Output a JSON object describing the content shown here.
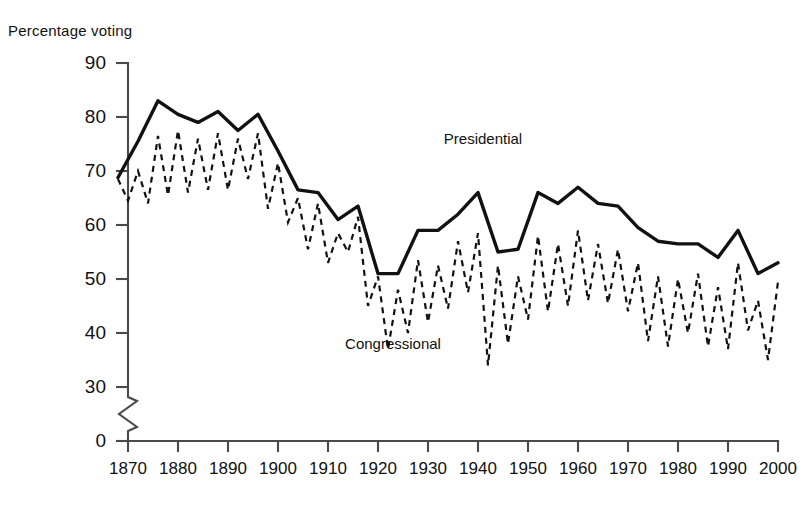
{
  "chart_data": {
    "type": "line",
    "title": "Percentage voting",
    "xlabel": "",
    "ylabel": "Percentage voting",
    "ylim": [
      0,
      90
    ],
    "xlim": [
      1868,
      2000
    ],
    "yticks": [
      0,
      30,
      40,
      50,
      60,
      70,
      80,
      90
    ],
    "xticks": [
      1870,
      1880,
      1890,
      1900,
      1910,
      1920,
      1930,
      1940,
      1950,
      1960,
      1970,
      1980,
      1990,
      2000
    ],
    "y_axis_break": true,
    "y_axis_break_between": [
      0,
      30
    ],
    "grid": false,
    "legend_position": "inline-annotations",
    "series": [
      {
        "name": "Presidential",
        "style": "solid",
        "color": "#111111",
        "label_position": {
          "x": 1941,
          "y": 75
        },
        "x": [
          1868,
          1872,
          1876,
          1880,
          1884,
          1888,
          1892,
          1896,
          1900,
          1904,
          1908,
          1912,
          1916,
          1920,
          1924,
          1928,
          1932,
          1936,
          1940,
          1944,
          1948,
          1952,
          1956,
          1960,
          1964,
          1968,
          1972,
          1976,
          1980,
          1984,
          1988,
          1992,
          1996,
          2000
        ],
        "values": [
          68.8,
          75.5,
          83.0,
          80.5,
          79.0,
          81.0,
          77.5,
          80.5,
          73.7,
          66.5,
          66.0,
          61.0,
          63.5,
          51.0,
          51.0,
          59.0,
          59.0,
          62.0,
          66.0,
          55.0,
          55.5,
          66.0,
          64.0,
          67.0,
          64.0,
          63.5,
          59.5,
          57.0,
          56.5,
          56.5,
          54.0,
          59.0,
          51.0,
          53.0
        ]
      },
      {
        "name": "Congressional",
        "style": "dashed",
        "color": "#111111",
        "label_position": {
          "x": 1923,
          "y": 37
        },
        "x": [
          1868,
          1870,
          1872,
          1874,
          1876,
          1878,
          1880,
          1882,
          1884,
          1886,
          1888,
          1890,
          1892,
          1894,
          1896,
          1898,
          1900,
          1902,
          1904,
          1906,
          1908,
          1910,
          1912,
          1914,
          1916,
          1918,
          1920,
          1922,
          1924,
          1926,
          1928,
          1930,
          1932,
          1934,
          1936,
          1938,
          1940,
          1942,
          1944,
          1946,
          1948,
          1950,
          1952,
          1954,
          1956,
          1958,
          1960,
          1962,
          1964,
          1966,
          1968,
          1970,
          1972,
          1974,
          1976,
          1978,
          1980,
          1982,
          1984,
          1986,
          1988,
          1990,
          1992,
          1994,
          1996,
          1998,
          2000
        ],
        "values": [
          68.5,
          64.5,
          70.0,
          64.0,
          76.5,
          65.5,
          77.5,
          66.0,
          76.0,
          66.5,
          77.0,
          66.5,
          76.0,
          68.5,
          77.0,
          63.0,
          71.5,
          60.5,
          65.0,
          55.5,
          64.0,
          53.0,
          58.5,
          55.0,
          61.5,
          45.0,
          50.5,
          37.0,
          48.0,
          40.0,
          53.5,
          42.0,
          52.5,
          44.5,
          57.0,
          47.5,
          58.5,
          34.0,
          52.5,
          38.0,
          50.5,
          42.5,
          58.0,
          44.0,
          56.5,
          45.0,
          59.0,
          46.0,
          56.5,
          45.5,
          55.5,
          44.0,
          53.0,
          38.5,
          50.5,
          37.5,
          50.0,
          40.0,
          51.0,
          37.5,
          48.5,
          37.0,
          53.0,
          40.5,
          46.0,
          35.0,
          49.5
        ]
      }
    ]
  },
  "labels": {
    "presidential": "Presidential",
    "congressional": "Congressional"
  }
}
